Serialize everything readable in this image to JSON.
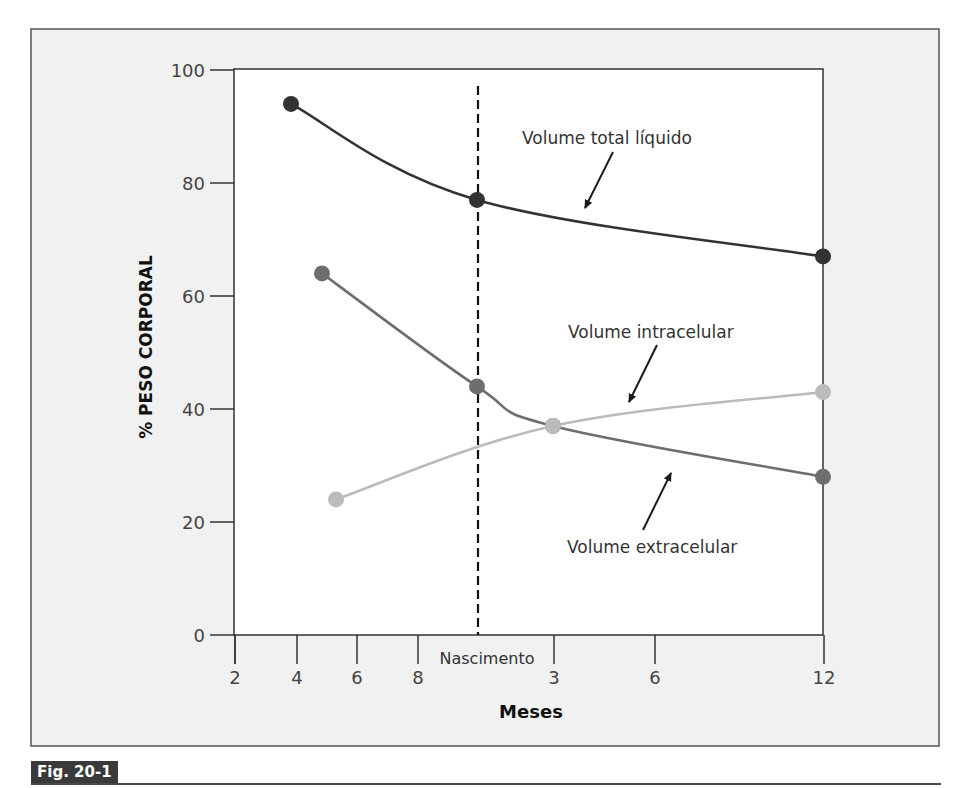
{
  "figure": {
    "caption_label": "Fig. 20-1",
    "frame_bg": "#f1f1f1",
    "plot_bg": "#ffffff"
  },
  "chart_data": {
    "type": "line",
    "title": "",
    "xlabel": "Meses",
    "ylabel": "% PESO CORPORAL",
    "ylim": [
      0,
      100
    ],
    "yticks": [
      0,
      20,
      40,
      60,
      80,
      100
    ],
    "x_ticks": [
      {
        "label": "2",
        "period": "fetal",
        "px": 235
      },
      {
        "label": "4",
        "period": "fetal",
        "px": 297
      },
      {
        "label": "6",
        "period": "fetal",
        "px": 357
      },
      {
        "label": "8",
        "period": "fetal",
        "px": 418
      },
      {
        "label": "3",
        "period": "postnatal",
        "px": 554
      },
      {
        "label": "6",
        "period": "postnatal",
        "px": 655
      },
      {
        "label": "12",
        "period": "postnatal",
        "px": 824
      }
    ],
    "birth_marker": {
      "label": "Nascimento",
      "px": 478,
      "style": "dashed"
    },
    "grid": false,
    "legend": "inline annotations with arrows",
    "series": [
      {
        "name": "Volume total líquido",
        "color": "#333333",
        "points": [
          {
            "x_label": "~4 meses (fetal)",
            "px": 291,
            "y": 94
          },
          {
            "x_label": "Nascimento",
            "px": 477,
            "y": 77
          },
          {
            "x_label": "12 meses",
            "px": 823,
            "y": 67
          }
        ]
      },
      {
        "name": "Volume extracelular",
        "color": "#6e6e6e",
        "points": [
          {
            "x_label": "~5 meses (fetal)",
            "px": 322,
            "y": 64
          },
          {
            "x_label": "Nascimento",
            "px": 477,
            "y": 44
          },
          {
            "x_label": "3 meses",
            "px": 553,
            "y": 37
          },
          {
            "x_label": "12 meses",
            "px": 823,
            "y": 28
          }
        ]
      },
      {
        "name": "Volume intracelular",
        "color": "#bbbbbb",
        "points": [
          {
            "x_label": "~5.5 meses (fetal)",
            "px": 336,
            "y": 24
          },
          {
            "x_label": "3 meses",
            "px": 553,
            "y": 37
          },
          {
            "x_label": "12 meses",
            "px": 823,
            "y": 43
          }
        ]
      }
    ],
    "annotations": [
      {
        "text": "Volume total líquido",
        "x": 522,
        "y": 144,
        "arrow": [
          613,
          152,
          585,
          208
        ]
      },
      {
        "text": "Volume intracelular",
        "x": 568,
        "y": 338,
        "arrow": [
          657,
          345,
          629,
          402
        ]
      },
      {
        "text": "Volume extracelular",
        "x": 567,
        "y": 553,
        "arrow": [
          643,
          530,
          671,
          473
        ]
      }
    ]
  }
}
